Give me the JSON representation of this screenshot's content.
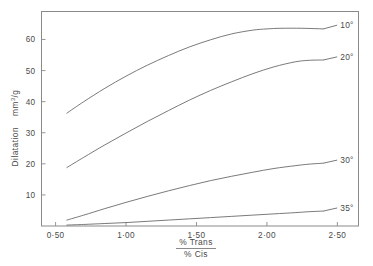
{
  "chart_data": {
    "type": "line",
    "title": "",
    "subtitle": "",
    "xlabel_numerator": "% Trans",
    "xlabel_denominator": "% Cis",
    "ylabel": "Dilatation  mm3/g",
    "ylabel_main": "Dilatation",
    "ylabel_units": "mm",
    "ylabel_units_sup": "3",
    "ylabel_units_tail": "/g",
    "xlim": [
      0.4,
      2.65
    ],
    "ylim": [
      0,
      69
    ],
    "grid": false,
    "legend_position": "right-inline-annotations",
    "xticks": [
      0.5,
      1.0,
      1.5,
      2.0,
      2.5
    ],
    "xtick_labels": [
      "0·50",
      "1·00",
      "1·50",
      "2·00",
      "2·50"
    ],
    "yticks": [
      10,
      20,
      30,
      40,
      50,
      60
    ],
    "ytick_labels": [
      "10",
      "20",
      "30",
      "40",
      "50",
      "60"
    ],
    "series": [
      {
        "name": "10°",
        "label": "10°",
        "color": "#6b6b6b",
        "x": [
          0.58,
          0.7,
          0.85,
          1.0,
          1.15,
          1.3,
          1.45,
          1.6,
          1.75,
          1.9,
          2.0,
          2.1,
          2.25,
          2.4
        ],
        "values": [
          36.3,
          40.0,
          44.3,
          48.2,
          51.7,
          54.8,
          57.6,
          59.9,
          61.8,
          63.0,
          63.4,
          63.6,
          63.6,
          63.4
        ]
      },
      {
        "name": "20°",
        "label": "20°",
        "color": "#6b6b6b",
        "x": [
          0.58,
          0.7,
          0.85,
          1.0,
          1.15,
          1.3,
          1.45,
          1.6,
          1.75,
          1.9,
          2.05,
          2.2,
          2.3,
          2.4
        ],
        "values": [
          18.8,
          22.1,
          26.1,
          29.9,
          33.6,
          37.1,
          40.5,
          43.6,
          46.4,
          49.0,
          51.2,
          52.8,
          53.3,
          53.4
        ]
      },
      {
        "name": "30°",
        "label": "30°",
        "color": "#6b6b6b",
        "x": [
          0.58,
          0.7,
          0.85,
          1.0,
          1.15,
          1.3,
          1.45,
          1.6,
          1.75,
          1.9,
          2.05,
          2.2,
          2.3,
          2.4
        ],
        "values": [
          1.9,
          3.5,
          5.6,
          7.6,
          9.5,
          11.3,
          13.0,
          14.6,
          16.0,
          17.3,
          18.5,
          19.4,
          19.9,
          20.2
        ]
      },
      {
        "name": "35°",
        "label": "35°",
        "color": "#6b6b6b",
        "x": [
          0.58,
          0.7,
          0.85,
          1.0,
          1.15,
          1.3,
          1.45,
          1.6,
          1.75,
          1.9,
          2.05,
          2.2,
          2.3,
          2.4
        ],
        "values": [
          0.3,
          0.5,
          0.8,
          1.1,
          1.5,
          1.9,
          2.3,
          2.7,
          3.1,
          3.5,
          3.9,
          4.3,
          4.6,
          4.8
        ]
      }
    ],
    "annotations": [
      {
        "label": "10°",
        "x": 2.52,
        "y": 63.8
      },
      {
        "label": "20°",
        "x": 2.52,
        "y": 53.6
      },
      {
        "label": "30°",
        "x": 2.52,
        "y": 20.4
      },
      {
        "label": "35°",
        "x": 2.52,
        "y": 5.0
      }
    ]
  },
  "style": {
    "frame_color": "#8a8a8a",
    "curve_color": "#6b6b6b",
    "text_color": "#4a4a4a",
    "background": "#ffffff"
  }
}
